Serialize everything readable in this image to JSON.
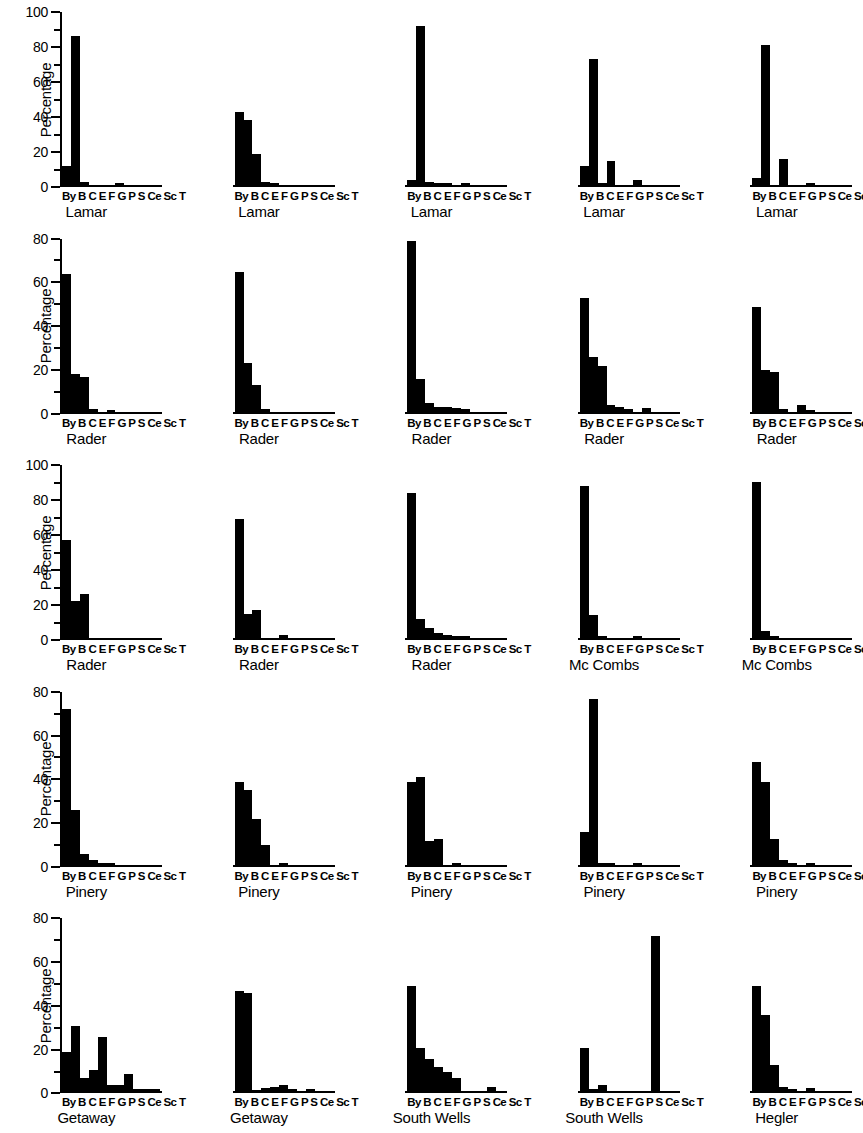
{
  "figure": {
    "y_axis_title": "Percentage",
    "category_label_string": "By B C E F G P S Ce Sc T",
    "categories": [
      "By",
      "B",
      "C",
      "E",
      "F",
      "G",
      "P",
      "S",
      "Ce",
      "Sc",
      "T"
    ],
    "bar_color": "#000000",
    "background_color": "#ffffff"
  },
  "chart_data": [
    {
      "type": "bar",
      "title": "Lamar",
      "ylabel": "Percentage",
      "xlabel": "",
      "ylim": [
        0,
        100
      ],
      "yticks": [
        0,
        20,
        40,
        60,
        80,
        100
      ],
      "grid": false,
      "categories": [
        "By",
        "B",
        "C",
        "E",
        "F",
        "G",
        "P",
        "S",
        "Ce",
        "Sc",
        "T"
      ],
      "values": [
        11,
        85,
        1.5,
        0,
        0,
        0,
        1,
        0,
        0,
        0,
        0
      ]
    },
    {
      "type": "bar",
      "title": "Lamar",
      "ylabel": "Percentage",
      "xlabel": "",
      "ylim": [
        0,
        100
      ],
      "yticks": [
        0,
        20,
        40,
        60,
        80,
        100
      ],
      "grid": false,
      "categories": [
        "By",
        "B",
        "C",
        "E",
        "F",
        "G",
        "P",
        "S",
        "Ce",
        "Sc",
        "T"
      ],
      "values": [
        42,
        37,
        18,
        2,
        0.7,
        0,
        0,
        0,
        0,
        0,
        0
      ]
    },
    {
      "type": "bar",
      "title": "Lamar",
      "ylabel": "Percentage",
      "xlabel": "",
      "ylim": [
        0,
        100
      ],
      "yticks": [
        0,
        20,
        40,
        60,
        80,
        100
      ],
      "grid": false,
      "categories": [
        "By",
        "B",
        "C",
        "E",
        "F",
        "G",
        "P",
        "S",
        "Ce",
        "Sc",
        "T"
      ],
      "values": [
        3,
        91,
        2,
        1,
        1,
        0,
        1,
        0,
        0,
        0,
        0
      ]
    },
    {
      "type": "bar",
      "title": "Lamar",
      "ylabel": "Percentage",
      "xlabel": "",
      "ylim": [
        0,
        100
      ],
      "yticks": [
        0,
        20,
        40,
        60,
        80,
        100
      ],
      "grid": false,
      "categories": [
        "By",
        "B",
        "C",
        "E",
        "F",
        "G",
        "P",
        "S",
        "Ce",
        "Sc",
        "T"
      ],
      "values": [
        11,
        72,
        1,
        14,
        0,
        0,
        3,
        0,
        0,
        0,
        0
      ]
    },
    {
      "type": "bar",
      "title": "Lamar",
      "ylabel": "Percentage",
      "xlabel": "",
      "ylim": [
        0,
        100
      ],
      "yticks": [
        0,
        20,
        40,
        60,
        80,
        100
      ],
      "grid": false,
      "categories": [
        "By",
        "B",
        "C",
        "E",
        "F",
        "G",
        "P",
        "S",
        "Ce",
        "Sc",
        "T"
      ],
      "values": [
        4,
        80,
        0,
        15,
        0,
        0,
        1,
        0,
        0,
        0,
        0
      ]
    },
    {
      "type": "bar",
      "title": "Rader",
      "ylabel": "Percentage",
      "xlabel": "",
      "ylim": [
        0,
        80
      ],
      "yticks": [
        0,
        20,
        40,
        60,
        80
      ],
      "grid": false,
      "categories": [
        "By",
        "B",
        "C",
        "E",
        "F",
        "G",
        "P",
        "S",
        "Ce",
        "Sc",
        "T"
      ],
      "values": [
        63,
        17,
        16,
        1,
        0,
        0.8,
        0,
        0,
        0,
        0,
        0
      ]
    },
    {
      "type": "bar",
      "title": "Rader",
      "ylabel": "Percentage",
      "xlabel": "",
      "ylim": [
        0,
        80
      ],
      "yticks": [
        0,
        20,
        40,
        60,
        80
      ],
      "grid": false,
      "categories": [
        "By",
        "B",
        "C",
        "E",
        "F",
        "G",
        "P",
        "S",
        "Ce",
        "Sc",
        "T"
      ],
      "values": [
        64,
        22,
        12,
        1,
        0,
        0,
        0,
        0,
        0,
        0,
        0
      ]
    },
    {
      "type": "bar",
      "title": "Rader",
      "ylabel": "Percentage",
      "xlabel": "",
      "ylim": [
        0,
        80
      ],
      "yticks": [
        0,
        20,
        40,
        60,
        80
      ],
      "grid": false,
      "categories": [
        "By",
        "B",
        "C",
        "E",
        "F",
        "G",
        "P",
        "S",
        "Ce",
        "Sc",
        "T"
      ],
      "values": [
        78,
        15,
        4,
        2,
        2,
        1.5,
        1,
        0,
        0,
        0,
        0
      ]
    },
    {
      "type": "bar",
      "title": "Rader",
      "ylabel": "Percentage",
      "xlabel": "",
      "ylim": [
        0,
        80
      ],
      "yticks": [
        0,
        20,
        40,
        60,
        80
      ],
      "grid": false,
      "categories": [
        "By",
        "B",
        "C",
        "E",
        "F",
        "G",
        "P",
        "S",
        "Ce",
        "Sc",
        "T"
      ],
      "values": [
        52,
        25,
        21,
        3,
        2,
        1,
        0,
        1.5,
        0,
        0,
        0
      ]
    },
    {
      "type": "bar",
      "title": "Rader",
      "ylabel": "Percentage",
      "xlabel": "",
      "ylim": [
        0,
        80
      ],
      "yticks": [
        0,
        20,
        40,
        60,
        80
      ],
      "grid": false,
      "categories": [
        "By",
        "B",
        "C",
        "E",
        "F",
        "G",
        "P",
        "S",
        "Ce",
        "Sc",
        "T"
      ],
      "values": [
        48,
        19,
        18,
        1,
        0,
        3,
        0.5,
        0,
        0,
        0,
        0
      ]
    },
    {
      "type": "bar",
      "title": "Rader",
      "ylabel": "Percentage",
      "xlabel": "",
      "ylim": [
        0,
        100
      ],
      "yticks": [
        0,
        20,
        40,
        60,
        80,
        100
      ],
      "grid": false,
      "categories": [
        "By",
        "B",
        "C",
        "E",
        "F",
        "G",
        "P",
        "S",
        "Ce",
        "Sc",
        "T"
      ],
      "values": [
        56,
        21,
        25,
        0,
        0,
        0,
        0,
        0,
        0,
        0,
        0
      ]
    },
    {
      "type": "bar",
      "title": "Rader",
      "ylabel": "Percentage",
      "xlabel": "",
      "ylim": [
        0,
        100
      ],
      "yticks": [
        0,
        20,
        40,
        60,
        80,
        100
      ],
      "grid": false,
      "categories": [
        "By",
        "B",
        "C",
        "E",
        "F",
        "G",
        "P",
        "S",
        "Ce",
        "Sc",
        "T"
      ],
      "values": [
        68,
        14,
        16,
        0,
        0,
        2,
        0,
        0,
        0,
        0,
        0
      ]
    },
    {
      "type": "bar",
      "title": "Rader",
      "ylabel": "Percentage",
      "xlabel": "",
      "ylim": [
        0,
        100
      ],
      "yticks": [
        0,
        20,
        40,
        60,
        80,
        100
      ],
      "grid": false,
      "categories": [
        "By",
        "B",
        "C",
        "E",
        "F",
        "G",
        "P",
        "S",
        "Ce",
        "Sc",
        "T"
      ],
      "values": [
        83,
        11,
        6,
        3,
        2,
        1,
        1,
        0,
        0,
        0,
        0
      ]
    },
    {
      "type": "bar",
      "title": "Mc Combs",
      "ylabel": "Percentage",
      "xlabel": "",
      "ylim": [
        0,
        100
      ],
      "yticks": [
        0,
        20,
        40,
        60,
        80,
        100
      ],
      "grid": false,
      "categories": [
        "By",
        "B",
        "C",
        "E",
        "F",
        "G",
        "P",
        "S",
        "Ce",
        "Sc",
        "T"
      ],
      "values": [
        87,
        13,
        1,
        0,
        0,
        0,
        1,
        0,
        0,
        0,
        0
      ]
    },
    {
      "type": "bar",
      "title": "Mc Combs",
      "ylabel": "Percentage",
      "xlabel": "",
      "ylim": [
        0,
        100
      ],
      "yticks": [
        0,
        20,
        40,
        60,
        80,
        100
      ],
      "grid": false,
      "categories": [
        "By",
        "B",
        "C",
        "E",
        "F",
        "G",
        "P",
        "S",
        "Ce",
        "Sc",
        "T"
      ],
      "values": [
        89,
        4,
        1,
        0,
        0,
        0,
        0,
        0,
        0,
        0,
        0
      ]
    },
    {
      "type": "bar",
      "title": "Pinery",
      "ylabel": "Percentage",
      "xlabel": "",
      "ylim": [
        0,
        80
      ],
      "yticks": [
        0,
        20,
        40,
        60,
        80
      ],
      "grid": false,
      "categories": [
        "By",
        "B",
        "C",
        "E",
        "F",
        "G",
        "P",
        "S",
        "Ce",
        "Sc",
        "T"
      ],
      "values": [
        71,
        25,
        5,
        2,
        1,
        1,
        0,
        0,
        0,
        0,
        0
      ]
    },
    {
      "type": "bar",
      "title": "Pinery",
      "ylabel": "Percentage",
      "xlabel": "",
      "ylim": [
        0,
        80
      ],
      "yticks": [
        0,
        20,
        40,
        60,
        80
      ],
      "grid": false,
      "categories": [
        "By",
        "B",
        "C",
        "E",
        "F",
        "G",
        "P",
        "S",
        "Ce",
        "Sc",
        "T"
      ],
      "values": [
        38,
        34,
        21,
        9,
        0,
        1,
        0,
        0,
        0,
        0,
        0
      ]
    },
    {
      "type": "bar",
      "title": "Pinery",
      "ylabel": "Percentage",
      "xlabel": "",
      "ylim": [
        0,
        80
      ],
      "yticks": [
        0,
        20,
        40,
        60,
        80
      ],
      "grid": false,
      "categories": [
        "By",
        "B",
        "C",
        "E",
        "F",
        "G",
        "P",
        "S",
        "Ce",
        "Sc",
        "T"
      ],
      "values": [
        38,
        40,
        11,
        12,
        0,
        1,
        0,
        0,
        0,
        0,
        0
      ]
    },
    {
      "type": "bar",
      "title": "Pinery",
      "ylabel": "Percentage",
      "xlabel": "",
      "ylim": [
        0,
        80
      ],
      "yticks": [
        0,
        20,
        40,
        60,
        80
      ],
      "grid": false,
      "categories": [
        "By",
        "B",
        "C",
        "E",
        "F",
        "G",
        "P",
        "S",
        "Ce",
        "Sc",
        "T"
      ],
      "values": [
        15,
        76,
        1,
        0.8,
        0,
        0,
        1,
        0,
        0,
        0,
        0
      ]
    },
    {
      "type": "bar",
      "title": "Pinery",
      "ylabel": "Percentage",
      "xlabel": "",
      "ylim": [
        0,
        80
      ],
      "yticks": [
        0,
        20,
        40,
        60,
        80
      ],
      "grid": false,
      "categories": [
        "By",
        "B",
        "C",
        "E",
        "F",
        "G",
        "P",
        "S",
        "Ce",
        "Sc",
        "T"
      ],
      "values": [
        47,
        38,
        12,
        2,
        1,
        0,
        1,
        0,
        0,
        0,
        0
      ]
    },
    {
      "type": "bar",
      "title": "Getaway",
      "ylabel": "Percentage",
      "xlabel": "",
      "ylim": [
        0,
        80
      ],
      "yticks": [
        0,
        20,
        40,
        60,
        80
      ],
      "grid": false,
      "categories": [
        "By",
        "B",
        "C",
        "E",
        "F",
        "G",
        "P",
        "S",
        "Ce",
        "Sc",
        "T"
      ],
      "values": [
        18,
        30,
        6,
        10,
        25,
        3,
        3,
        8,
        1,
        1,
        1
      ]
    },
    {
      "type": "bar",
      "title": "Getaway",
      "ylabel": "Percentage",
      "xlabel": "",
      "ylim": [
        0,
        80
      ],
      "yticks": [
        0,
        20,
        40,
        60,
        80
      ],
      "grid": false,
      "categories": [
        "By",
        "B",
        "C",
        "E",
        "F",
        "G",
        "P",
        "S",
        "Ce",
        "Sc",
        "T"
      ],
      "values": [
        46,
        45,
        0.5,
        1.5,
        2,
        3,
        1,
        0,
        1,
        0,
        0
      ]
    },
    {
      "type": "bar",
      "title": "South Wells",
      "ylabel": "Percentage",
      "xlabel": "",
      "ylim": [
        0,
        80
      ],
      "yticks": [
        0,
        20,
        40,
        60,
        80
      ],
      "grid": false,
      "categories": [
        "By",
        "B",
        "C",
        "E",
        "F",
        "G",
        "P",
        "S",
        "Ce",
        "Sc",
        "T"
      ],
      "values": [
        48,
        20,
        15,
        11,
        9,
        6,
        0,
        0,
        0,
        2,
        0
      ]
    },
    {
      "type": "bar",
      "title": "South Wells",
      "ylabel": "Percentage",
      "xlabel": "",
      "ylim": [
        0,
        80
      ],
      "yticks": [
        0,
        20,
        40,
        60,
        80
      ],
      "grid": false,
      "categories": [
        "By",
        "B",
        "C",
        "E",
        "F",
        "G",
        "P",
        "S",
        "Ce",
        "Sc",
        "T"
      ],
      "values": [
        20,
        1,
        3,
        0,
        0,
        0,
        0,
        0,
        71,
        0,
        0
      ]
    },
    {
      "type": "bar",
      "title": "Hegler",
      "ylabel": "Percentage",
      "xlabel": "",
      "ylim": [
        0,
        80
      ],
      "yticks": [
        0,
        20,
        40,
        60,
        80
      ],
      "grid": false,
      "categories": [
        "By",
        "B",
        "C",
        "E",
        "F",
        "G",
        "P",
        "S",
        "Ce",
        "Sc",
        "T"
      ],
      "values": [
        48,
        35,
        12,
        2,
        1,
        0,
        1.5,
        0,
        0,
        0,
        0
      ]
    }
  ]
}
